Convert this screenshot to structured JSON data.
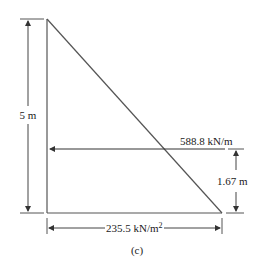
{
  "figure": {
    "caption": "(c)",
    "labels": {
      "height": "5 m",
      "resultant_force": "588.8 kN/m",
      "resultant_location": "1.67 m",
      "base_pressure": "235.5 kN/m",
      "base_pressure_exp": "2"
    },
    "colors": {
      "line": "#333333",
      "background": "#ffffff"
    }
  }
}
